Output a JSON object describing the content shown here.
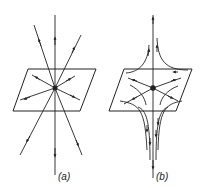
{
  "figure": {
    "panels": [
      {
        "id": "a",
        "label": "(a)",
        "description": "radial flow lines through a point on a plane"
      },
      {
        "id": "b",
        "label": "(b)",
        "description": "curved flow lines converging along a vertical axis through a point on a plane"
      }
    ],
    "colors": {
      "stroke": "#222222",
      "background": "#ffffff"
    }
  }
}
